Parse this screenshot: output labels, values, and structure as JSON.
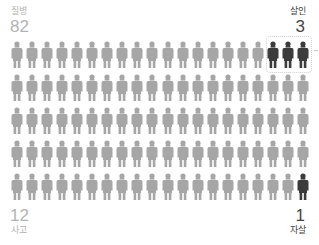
{
  "chart_data": {
    "type": "pictogram",
    "title": "",
    "total_icons": 100,
    "grid": {
      "columns": 20,
      "rows": 5
    },
    "categories": [
      "질병",
      "살인",
      "사고",
      "자살"
    ],
    "values": [
      82,
      3,
      12,
      1
    ],
    "colors": {
      "질병": "#a6a6a6",
      "사고": "#a6a6a6",
      "살인": "#3b3b3b",
      "자살": "#3b3b3b"
    },
    "highlighted": [
      {
        "category": "살인",
        "row": 0,
        "columns": [
          17,
          18,
          19
        ]
      },
      {
        "category": "자살",
        "row": 4,
        "columns": [
          19
        ]
      }
    ]
  },
  "labels": {
    "top_left": {
      "category": "질병",
      "value": "82"
    },
    "top_right": {
      "category": "살인",
      "value": "3"
    },
    "bottom_left": {
      "category": "사고",
      "value": "12"
    },
    "bottom_right": {
      "category": "자살",
      "value": "1"
    }
  },
  "more_indicator": "···",
  "colors": {
    "light_icon": "#a6a6a6",
    "dark_icon": "#3b3b3b",
    "light_text": "#b3b3b3",
    "dark_text": "#444444"
  }
}
